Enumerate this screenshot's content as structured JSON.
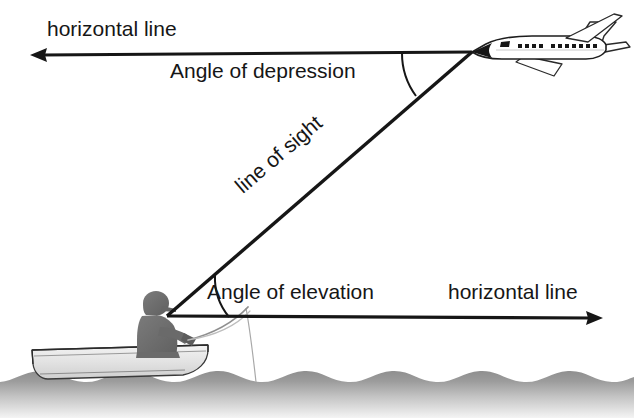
{
  "diagram": {
    "labels": {
      "horizontal_line_top": "horizontal line",
      "angle_of_depression": "Angle of depression",
      "line_of_sight": "line of sight",
      "angle_of_elevation": "Angle of elevation",
      "horizontal_line_bottom": "horizontal line"
    },
    "colors": {
      "stroke": "#161616",
      "text": "#161616",
      "background": "#ffffff",
      "figure_fill": "#6f6f6f",
      "boat_fill": "#d8d8d8",
      "water_top": "#8a8a8a",
      "water_bottom": "#efefef",
      "plane_fill": "#ffffff",
      "plane_nose_fill": "#161616"
    },
    "elements": {
      "airplane": "airplane-icon",
      "boat": "rowboat-icon",
      "fisherman": "fisherman-silhouette-icon",
      "fishing_rod": "fishing-rod-icon",
      "water": "water-surface",
      "depression_arc": "angle-depression-arc",
      "elevation_arc": "angle-elevation-arc",
      "sight_line": "line-of-sight-ray",
      "top_horizontal_ray": "top-horizontal-ray",
      "bottom_horizontal_ray": "bottom-horizontal-ray"
    },
    "geometry": {
      "plane_vertex": [
        472,
        52
      ],
      "boat_vertex": [
        167,
        315
      ],
      "top_ray_arrow_tip": [
        30,
        55
      ],
      "bottom_ray_arrow_tip": [
        601,
        318
      ],
      "line_of_sight_angle_deg": 40.5
    }
  }
}
